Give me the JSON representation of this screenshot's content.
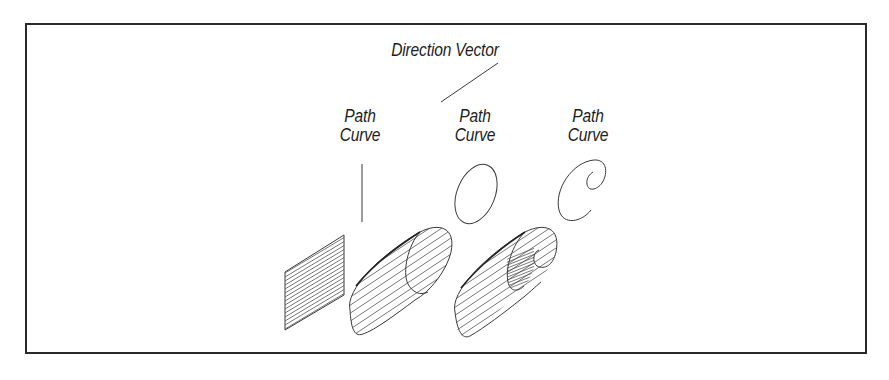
{
  "diagram": {
    "title_label": "Direction Vector",
    "path_curves": [
      {
        "line1": "Path",
        "line2": "Curve",
        "curve_shape": "straight-line",
        "result_shape": "flat-plane"
      },
      {
        "line1": "Path",
        "line2": "Curve",
        "curve_shape": "ellipse",
        "result_shape": "elliptic-cylinder"
      },
      {
        "line1": "Path",
        "line2": "Curve",
        "curve_shape": "spiral",
        "result_shape": "spiral-cylinder"
      }
    ],
    "colors": {
      "stroke": "#3a3a3a",
      "border": "#2a2a2a",
      "background": "#ffffff"
    }
  }
}
